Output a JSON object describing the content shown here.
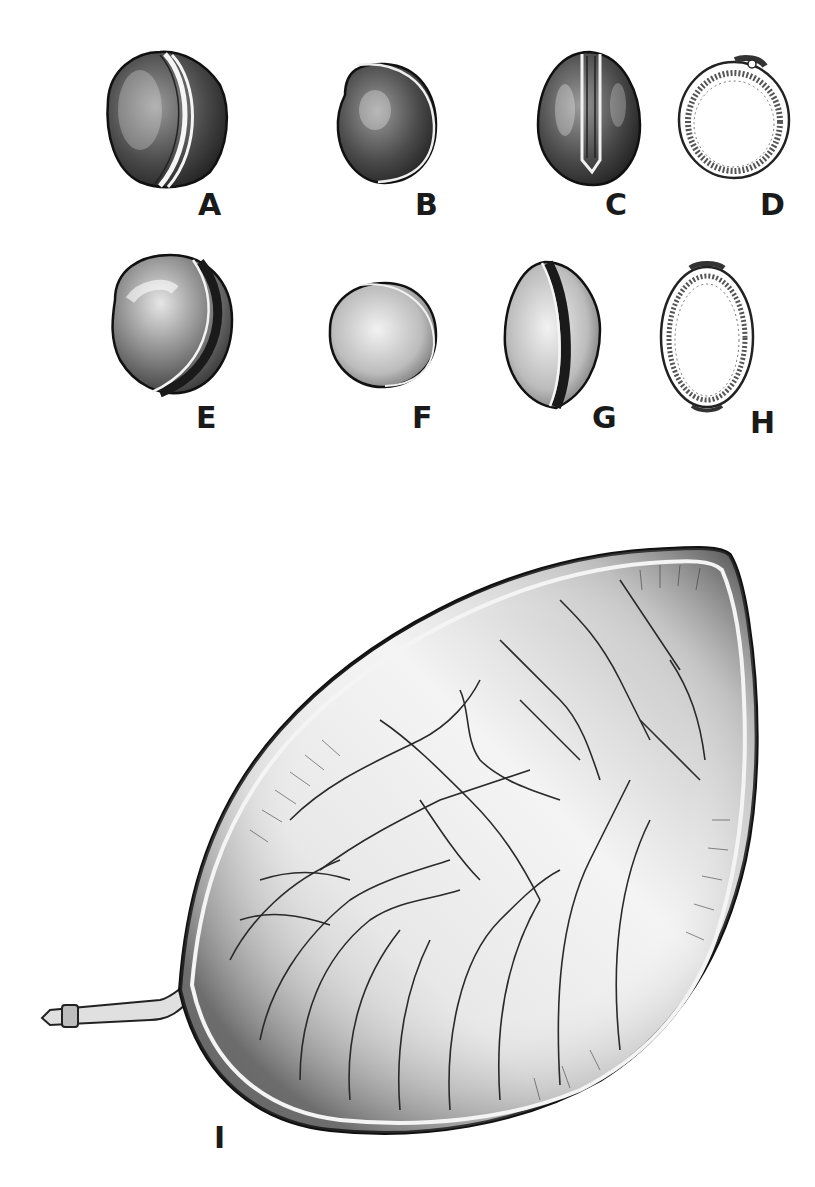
{
  "plate": {
    "background": "#ffffff",
    "ink_color": "#1a1a1a",
    "figures": [
      {
        "id": "A",
        "label": "A",
        "description": "seed, side view with raphe ridge"
      },
      {
        "id": "B",
        "label": "B",
        "description": "seed, lateral view"
      },
      {
        "id": "C",
        "label": "C",
        "description": "seed, view along raphe groove"
      },
      {
        "id": "D",
        "label": "D",
        "description": "seed, transverse section (round)"
      },
      {
        "id": "E",
        "label": "E",
        "description": "seed, side view with dark raphe band"
      },
      {
        "id": "F",
        "label": "F",
        "description": "seed, lateral view (rounded)"
      },
      {
        "id": "G",
        "label": "G",
        "description": "seed, view along dark raphe band"
      },
      {
        "id": "H",
        "label": "H",
        "description": "seed, longitudinal section (oval)"
      },
      {
        "id": "I",
        "label": "I",
        "description": "open pod valve with stalk, reticulate venation"
      }
    ]
  }
}
